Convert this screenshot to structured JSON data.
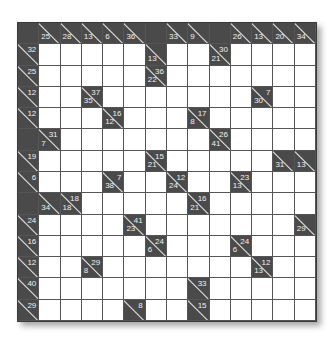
{
  "puzzle": {
    "type": "kakuro",
    "rows": 14,
    "cols": 14,
    "grid": [
      [
        "B",
        {
          "d": 25
        },
        {
          "d": 28
        },
        {
          "d": 13
        },
        {
          "d": 6
        },
        {
          "d": 36
        },
        "B",
        {
          "d": 33
        },
        {
          "d": 9
        },
        "B",
        {
          "d": 26
        },
        {
          "d": 13
        },
        {
          "d": 20
        },
        {
          "d": 34
        }
      ],
      [
        {
          "r": 32
        },
        "W",
        "W",
        "W",
        "W",
        "W",
        {
          "d": 13
        },
        "W",
        "W",
        {
          "r": 30,
          "d": 21
        },
        "W",
        "W",
        "W",
        "W"
      ],
      [
        {
          "r": 25
        },
        "W",
        "W",
        "W",
        "W",
        "W",
        {
          "r": 36,
          "d": 22
        },
        "W",
        "W",
        "W",
        "W",
        "W",
        "W",
        "W"
      ],
      [
        {
          "r": 12
        },
        "W",
        "W",
        {
          "r": 37,
          "d": 35
        },
        "W",
        "W",
        "W",
        "W",
        "W",
        "W",
        "W",
        {
          "r": 7,
          "d": 30
        },
        "W",
        "W"
      ],
      [
        {
          "r": 12
        },
        "W",
        "W",
        "W",
        {
          "r": 16,
          "d": 12
        },
        "W",
        "W",
        "W",
        {
          "r": 17,
          "d": 8
        },
        "W",
        "W",
        "W",
        "W",
        "W"
      ],
      [
        "B",
        {
          "r": 31,
          "d": 7
        },
        "W",
        "W",
        "W",
        "W",
        "W",
        "W",
        "W",
        {
          "r": 26,
          "d": 41
        },
        "W",
        "W",
        "W",
        "W"
      ],
      [
        {
          "r": 19
        },
        "W",
        "W",
        "W",
        "W",
        "W",
        {
          "r": 15,
          "d": 21
        },
        "W",
        "W",
        "W",
        "W",
        "W",
        {
          "d": 31
        },
        {
          "d": 13
        }
      ],
      [
        {
          "r": 6
        },
        "W",
        "W",
        "W",
        {
          "r": 7,
          "d": 38
        },
        "W",
        "W",
        {
          "r": 12,
          "d": 24
        },
        "W",
        "W",
        {
          "r": 23,
          "d": 13
        },
        "W",
        "W",
        "W"
      ],
      [
        "B",
        {
          "d": 34
        },
        {
          "r": 18,
          "d": 18
        },
        "W",
        "W",
        "W",
        "W",
        "W",
        {
          "r": 16,
          "d": 21
        },
        "W",
        "W",
        "W",
        "W",
        "W"
      ],
      [
        {
          "r": 24
        },
        "W",
        "W",
        "W",
        "W",
        {
          "r": 41,
          "d": 23
        },
        "W",
        "W",
        "W",
        "W",
        "W",
        "W",
        "W",
        {
          "d": 29
        }
      ],
      [
        {
          "r": 16
        },
        "W",
        "W",
        "W",
        "W",
        "W",
        {
          "r": 24,
          "d": 6
        },
        "W",
        "W",
        "W",
        {
          "r": 24,
          "d": 6
        },
        "W",
        "W",
        "W"
      ],
      [
        {
          "r": 12
        },
        "W",
        "W",
        {
          "r": 29,
          "d": 8
        },
        "W",
        "W",
        "W",
        "W",
        "W",
        "W",
        "W",
        {
          "r": 12,
          "d": 13
        },
        "W",
        "W"
      ],
      [
        {
          "r": 40
        },
        "W",
        "W",
        "W",
        "W",
        "W",
        "W",
        "W",
        {
          "r": 33
        },
        "W",
        "W",
        "W",
        "W",
        "W"
      ],
      [
        {
          "r": 29
        },
        "W",
        "W",
        "W",
        "W",
        {
          "r": 8
        },
        "W",
        "W",
        {
          "r": 15
        },
        "W",
        "W",
        "W",
        "W",
        "W"
      ]
    ]
  }
}
